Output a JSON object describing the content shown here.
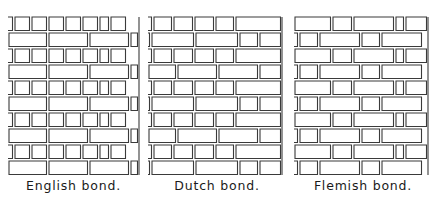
{
  "style": {
    "stroke": "#3a3a3a",
    "brick_fill": "#ffffff",
    "mortar": "#ffffff"
  },
  "panels": [
    {
      "id": "english",
      "caption": "English bond.",
      "x": 8,
      "y": 16,
      "width": 131,
      "row_height": 16,
      "rows": [
        [
          -6,
          17,
          17,
          17,
          17,
          17,
          11,
          17
        ],
        [
          40,
          41,
          41,
          9
        ],
        [
          -6,
          17,
          17,
          17,
          17,
          17,
          11,
          17
        ],
        [
          40,
          41,
          41,
          9
        ],
        [
          -6,
          17,
          17,
          17,
          17,
          17,
          11,
          17
        ],
        [
          40,
          41,
          41,
          9
        ],
        [
          -6,
          17,
          17,
          17,
          17,
          17,
          11,
          17
        ],
        [
          40,
          41,
          41,
          9
        ],
        [
          -6,
          17,
          17,
          17,
          17,
          17,
          11,
          17
        ],
        [
          40,
          41,
          41,
          9
        ]
      ]
    },
    {
      "id": "dutch",
      "caption": "Dutch bond.",
      "x": 148,
      "y": 16,
      "width": 134,
      "row_height": 16,
      "rows": [
        [
          -5,
          20,
          21,
          21,
          20,
          47
        ],
        [
          -3,
          44,
          44,
          20,
          23
        ],
        [
          -5,
          20,
          21,
          21,
          20,
          47
        ],
        [
          29,
          41,
          41,
          23
        ],
        [
          -5,
          20,
          21,
          21,
          20,
          47
        ],
        [
          -3,
          44,
          44,
          20,
          23
        ],
        [
          -5,
          20,
          21,
          21,
          20,
          47
        ],
        [
          29,
          41,
          41,
          23
        ],
        [
          -5,
          20,
          21,
          21,
          20,
          47
        ],
        [
          -3,
          44,
          44,
          20,
          23
        ]
      ]
    },
    {
      "id": "flemish",
      "caption": "Flemish bond.",
      "x": 294,
      "y": 16,
      "width": 134,
      "row_height": 16,
      "rows": [
        [
          38,
          21,
          42,
          10,
          23
        ],
        [
          -5,
          20,
          42,
          20,
          42
        ],
        [
          38,
          21,
          42,
          10,
          23
        ],
        [
          -5,
          20,
          42,
          20,
          42
        ],
        [
          38,
          21,
          42,
          10,
          23
        ],
        [
          -5,
          20,
          42,
          20,
          42
        ],
        [
          38,
          21,
          42,
          10,
          23
        ],
        [
          -5,
          20,
          42,
          20,
          42
        ],
        [
          38,
          21,
          42,
          10,
          23
        ],
        [
          -5,
          20,
          42,
          20,
          42
        ]
      ]
    }
  ]
}
